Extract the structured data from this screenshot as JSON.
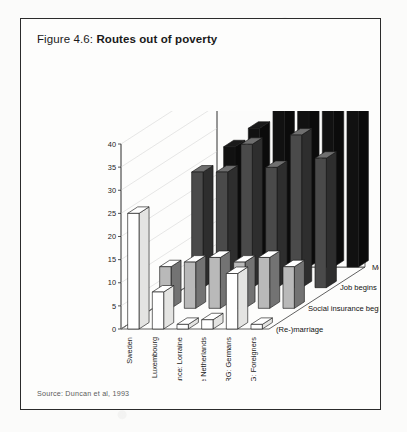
{
  "figure": {
    "label": "Figure 4.6:",
    "title": "Routes out of poverty",
    "source": "Source: Duncan et al, 1993"
  },
  "chart_data": {
    "type": "bar",
    "variant": "3d-grouped",
    "title": "Routes out of poverty",
    "xlabel": "",
    "ylabel": "% poor affected",
    "zlabel": "",
    "ylim": [
      0,
      40
    ],
    "yticks": [
      0,
      5,
      10,
      15,
      20,
      25,
      30,
      35,
      40
    ],
    "grid": false,
    "legend": "depth-axis-right",
    "categories": [
      "Sweden",
      "Luxembourg",
      "France: Lorraine",
      "The Netherlands",
      "FRG: Germans",
      "FRG: Foreigners"
    ],
    "series": [
      {
        "name": "More work",
        "color": "#111111",
        "values": [
          26,
          30,
          40,
          35,
          41,
          38
        ]
      },
      {
        "name": "Job begins",
        "color": "#4a4a4a",
        "values": [
          25,
          25,
          31,
          26,
          33,
          28
        ]
      },
      {
        "name": "Social insurance begins",
        "color": "#b9b9b9",
        "values": [
          9,
          10,
          11,
          10,
          11,
          9
        ]
      },
      {
        "name": "(Re-)marriage",
        "color": "#ffffff",
        "values": [
          25,
          8,
          1,
          2,
          12,
          1
        ]
      }
    ],
    "axis_titles": {
      "vertical": "% poor affected"
    },
    "tick_labels": [
      "0",
      "5",
      "10",
      "15",
      "20",
      "25",
      "30",
      "35",
      "40"
    ],
    "series_labels": [
      "More work",
      "Job begins",
      "Social insurance begins",
      "(Re-)marriage"
    ]
  }
}
